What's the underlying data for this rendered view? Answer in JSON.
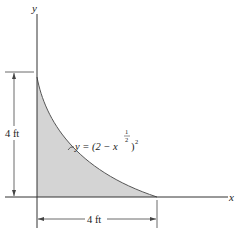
{
  "axes": {
    "x_label": "x",
    "y_label": "y"
  },
  "curve": {
    "equation_prefix": "y = (2 − x",
    "exponent_num": "1",
    "exponent_den": "2",
    "equation_suffix": ")",
    "outer_exponent": "2",
    "fill_color": "#d4d4d4"
  },
  "dimensions": {
    "height_label": "4 ft",
    "width_label": "4 ft"
  }
}
